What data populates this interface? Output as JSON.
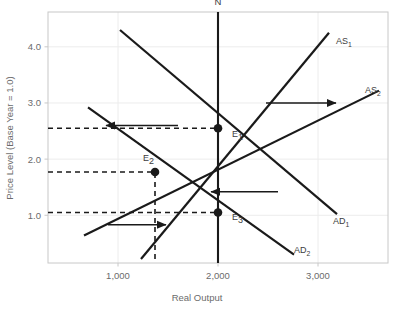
{
  "chart_data": {
    "type": "line",
    "title": "",
    "xlabel": "Real Output",
    "ylabel": "Price Level (Base Year = 1.0)",
    "grid": true,
    "legend_position": "inline-curve-labels",
    "xlim": [
      300,
      3700
    ],
    "ylim": [
      0.15,
      4.62
    ],
    "xticks": [
      1000,
      2000,
      3000
    ],
    "xtick_labels": [
      "1,000",
      "2,000",
      "3,000"
    ],
    "yticks": [
      1.0,
      2.0,
      3.0,
      4.0
    ],
    "ytick_labels": [
      "1.0",
      "2.0",
      "3.0",
      "4.0"
    ],
    "series": [
      {
        "name": "AS1",
        "label": "AS",
        "label_sub": "1",
        "type": "supply",
        "points": [
          [
            1230,
            0.22
          ],
          [
            3110,
            4.25
          ]
        ],
        "label_x": 3180,
        "label_y": 4.05
      },
      {
        "name": "AS2",
        "label": "AS",
        "label_sub": "2",
        "type": "supply",
        "points": [
          [
            660,
            0.64
          ],
          [
            3610,
            3.22
          ]
        ],
        "label_x": 3470,
        "label_y": 3.18
      },
      {
        "name": "AD1",
        "label": "AD",
        "label_sub": "1",
        "type": "demand",
        "points": [
          [
            1020,
            4.3
          ],
          [
            3190,
            1.02
          ]
        ],
        "label_x": 3150,
        "label_y": 0.85
      },
      {
        "name": "AD2",
        "label": "AD",
        "label_sub": "2",
        "type": "demand",
        "points": [
          [
            700,
            2.92
          ],
          [
            2760,
            0.3
          ]
        ],
        "label_x": 2760,
        "label_y": 0.33
      },
      {
        "name": "N",
        "label": "N",
        "label_sub": "",
        "type": "vertical-potential-output",
        "points": [
          [
            2000,
            0.15
          ],
          [
            2000,
            4.62
          ]
        ],
        "label_x": 2000,
        "label_y": 4.75
      }
    ],
    "equilibria": [
      {
        "name": "E1",
        "label": "E",
        "label_sub": "1",
        "x": 2000,
        "y": 2.55,
        "label_dx": 14,
        "label_dy": 9
      },
      {
        "name": "E2",
        "label": "E",
        "label_sub": "2",
        "x": 1370,
        "y": 1.77,
        "label_dx": -12,
        "label_dy": -11
      },
      {
        "name": "E3",
        "label": "E",
        "label_sub": "3",
        "x": 2000,
        "y": 1.05,
        "label_dx": 14,
        "label_dy": 8
      }
    ],
    "dashed_guides": [
      {
        "name": "price-guide-e1",
        "orientation": "horizontal",
        "value": 2.55,
        "from": 300,
        "to": 2000
      },
      {
        "name": "price-guide-e2",
        "orientation": "horizontal",
        "value": 1.77,
        "from": 300,
        "to": 1370
      },
      {
        "name": "price-guide-e3",
        "orientation": "horizontal",
        "value": 1.05,
        "from": 300,
        "to": 2000
      },
      {
        "name": "output-guide-e2",
        "orientation": "vertical",
        "value": 1370,
        "from": 0.22,
        "to": 1.77
      }
    ],
    "arrows": [
      {
        "name": "price-decrease-arrow",
        "direction": "left",
        "x1": 1600,
        "x2": 880,
        "y": 2.6
      },
      {
        "name": "supply-increase-arrow",
        "direction": "right",
        "x1": 2480,
        "x2": 3180,
        "y": 3.0
      },
      {
        "name": "demand-decrease-arrow",
        "direction": "left",
        "x1": 2600,
        "x2": 1930,
        "y": 1.42
      },
      {
        "name": "output-increase-arrow",
        "direction": "right",
        "x1": 900,
        "x2": 1480,
        "y": 0.83
      }
    ],
    "colors": {
      "curve": "#1a1a1a",
      "grid": "#ececec",
      "frame": "#c8c8c8",
      "tick_text": "#6b6b6b",
      "label_text": "#3d3d3d",
      "background": "#ffffff"
    }
  }
}
